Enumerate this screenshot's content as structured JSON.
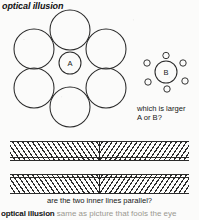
{
  "page": {
    "headword": "optical illusion",
    "background_color": "#fbfbfa",
    "ink_color": "#2b2b2b"
  },
  "figures": [
    {
      "id": "ebbinghaus-large-surround",
      "name": "ebbinghaus-left",
      "center_label": "A",
      "center_circle_radius": 11,
      "surround_circle_radius": 20,
      "surround_count": 6,
      "description": "central circle A ringed by six large circles"
    },
    {
      "id": "ebbinghaus-small-surround",
      "name": "ebbinghaus-right",
      "center_label": "B",
      "center_circle_radius": 11,
      "surround_circle_radius": 3.2,
      "surround_count": 6,
      "description": "central circle B ringed by six small circles"
    }
  ],
  "questions": {
    "circles": [
      "which is larger",
      "A or B?"
    ],
    "lines": "are the two inner lines parallel?"
  },
  "hatch_figures": [
    {
      "id": "hering-band-top",
      "name": "hatched-band-top",
      "hatch_angle_left_deg": 56,
      "hatch_angle_right_deg": -56,
      "inner_line_position": "bottom"
    },
    {
      "id": "hering-band-bottom",
      "name": "hatched-band-bottom",
      "hatch_angle_left_deg": 56,
      "hatch_angle_right_deg": -56,
      "inner_line_position": "top"
    }
  ],
  "entry": {
    "term": "optical illusion",
    "definition": "same as picture that fools the eye"
  }
}
